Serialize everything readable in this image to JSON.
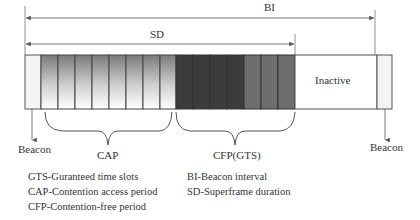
{
  "diagram": {
    "intervals": {
      "bi_label": "BI",
      "sd_label": "SD"
    },
    "superframe": {
      "beacon_start_color": "#f2f2f2",
      "cap_slot_count": 8,
      "cfp_dark_count": 4,
      "cfp_mid_count": 3,
      "inactive_label": "Inactive",
      "colors": {
        "outline": "#555555",
        "cfp_dark": "#3c3c3c",
        "cfp_mid": "#6e6e6e",
        "cap_top": "#7a7a7a",
        "cap_bottom": "#ffffff"
      }
    },
    "annotations": {
      "beacon_left": "Beacon",
      "beacon_right": "Beacon",
      "cap": "CAP",
      "cfp": "CFP(GTS)"
    },
    "legend": {
      "left": [
        "GTS-Guranteed time slots",
        "CAP-Contention access period",
        "CFP-Contention-free period"
      ],
      "right": [
        "BI-Beacon interval",
        "SD-Superframe duration"
      ]
    }
  }
}
